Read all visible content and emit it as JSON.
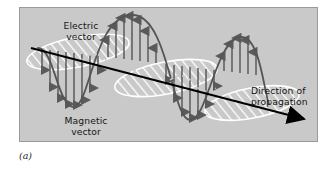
{
  "figure": {
    "caption": "(a)",
    "panel_background": "#c9c9c9",
    "border_color": "#9a9a9a",
    "page_background": "#ffffff",
    "labels": {
      "electric": "Electric\nvector",
      "magnetic": "Magnetic\nvector",
      "direction": "Direction of\npropagation"
    },
    "colors": {
      "wave_curve": "#555555",
      "field_arrow": "#5a5a5a",
      "magnetic_hatch": "#ffffff",
      "propagation_axis": "#000000",
      "text": "#161616"
    },
    "diagram": {
      "subject": "electromagnetic-wave",
      "electric_field_orientation": "vertical",
      "magnetic_field_orientation": "horizontal-perpendicular",
      "wave_cycles": "2.25",
      "propagation_direction": "left-to-right-descending"
    }
  }
}
